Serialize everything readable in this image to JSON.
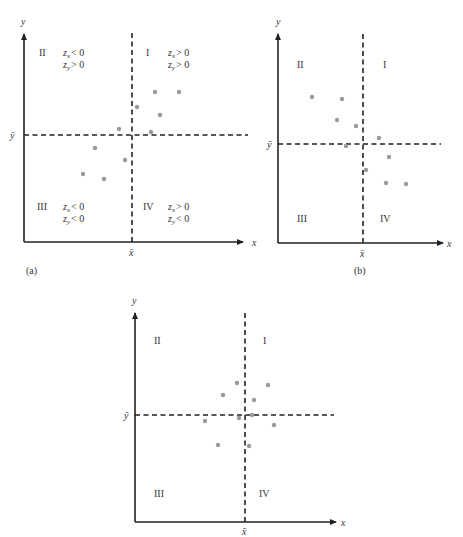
{
  "chart_data": [
    {
      "type": "scatter",
      "caption": "(a)",
      "xlabel": "x",
      "ylabel": "y",
      "xmean_label": "x̄",
      "ymean_label": "ȳ",
      "quadrants": [
        {
          "id": "I",
          "cond1": "zx > 0",
          "cond2": "zy > 0"
        },
        {
          "id": "II",
          "cond1": "zx < 0",
          "cond2": "zy > 0"
        },
        {
          "id": "III",
          "cond1": "zx < 0",
          "cond2": "zy < 0"
        },
        {
          "id": "IV",
          "cond1": "zx > 0",
          "cond2": "zy < 0"
        }
      ],
      "description": "Positive linear association: points mostly in quadrants I and III",
      "points_px": [
        [
          155,
          92
        ],
        [
          179,
          92
        ],
        [
          137,
          107
        ],
        [
          160,
          115
        ],
        [
          119,
          129
        ],
        [
          151,
          132
        ],
        [
          95,
          148
        ],
        [
          125,
          160
        ],
        [
          83,
          174
        ],
        [
          104,
          179
        ]
      ]
    },
    {
      "type": "scatter",
      "caption": "(b)",
      "xlabel": "x",
      "ylabel": "y",
      "xmean_label": "x̄",
      "ymean_label": "ȳ",
      "quadrants": [
        {
          "id": "I"
        },
        {
          "id": "II"
        },
        {
          "id": "III"
        },
        {
          "id": "IV"
        }
      ],
      "description": "Negative linear association: points mostly in quadrants II and IV",
      "points_px": [
        [
          312,
          97
        ],
        [
          342,
          99
        ],
        [
          337,
          120
        ],
        [
          356,
          126
        ],
        [
          379,
          138
        ],
        [
          346,
          146
        ],
        [
          389,
          157
        ],
        [
          366,
          170
        ],
        [
          386,
          183
        ],
        [
          406,
          184
        ]
      ]
    },
    {
      "type": "scatter",
      "caption": "",
      "xlabel": "x",
      "ylabel": "y",
      "xmean_label": "x̄",
      "ymean_label": "ȳ",
      "quadrants": [
        {
          "id": "I"
        },
        {
          "id": "II"
        },
        {
          "id": "III"
        },
        {
          "id": "IV"
        }
      ],
      "description": "No linear association: points scattered around the means in all quadrants",
      "points_px": [
        [
          237,
          383
        ],
        [
          268,
          385
        ],
        [
          223,
          395
        ],
        [
          254,
          400
        ],
        [
          205,
          421
        ],
        [
          239,
          418
        ],
        [
          252,
          415
        ],
        [
          274,
          425
        ],
        [
          218,
          445
        ],
        [
          249,
          446
        ]
      ]
    }
  ],
  "panels": {
    "a": {
      "caption": "(a)",
      "x_axis": "x",
      "y_axis": "y",
      "x_mean": "x̄",
      "y_mean": "ȳ",
      "q1": "I",
      "q2": "II",
      "q3": "III",
      "q4": "IV",
      "q1_c1": "> 0",
      "q1_c2": "> 0",
      "q2_c1": "< 0",
      "q2_c2": "> 0",
      "q3_c1": "< 0",
      "q3_c2": "< 0",
      "q4_c1": "> 0",
      "q4_c2": "< 0"
    },
    "b": {
      "caption": "(b)",
      "x_axis": "x",
      "y_axis": "y",
      "x_mean": "x̄",
      "y_mean": "ȳ",
      "q1": "I",
      "q2": "II",
      "q3": "III",
      "q4": "IV"
    },
    "c": {
      "x_axis": "x",
      "y_axis": "y",
      "x_mean": "x̄",
      "y_mean": "ȳ",
      "q1": "I",
      "q2": "II",
      "q3": "III",
      "q4": "IV"
    }
  },
  "colors": {
    "axis": "#222222",
    "points": "#9a9a9a"
  }
}
